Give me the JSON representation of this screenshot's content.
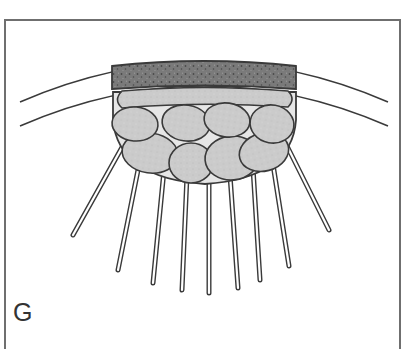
{
  "figure": {
    "panel_label": "G"
  },
  "colors": {
    "frame": "#6f6f6f",
    "outline": "#3a3a3a",
    "dark_band": "#7a7a7a",
    "dark_band_speckle": "#4a4a4a",
    "light_cell": "#cbcbcb",
    "bowl_fill": "#e6e6e6",
    "rod_fill": "#ffffff",
    "label": "#333333"
  },
  "parts": {
    "arcs": [
      "outer-arc",
      "inner-arc"
    ],
    "band": "dark-band",
    "top_cell": "elongated-cell",
    "cell_count": 8,
    "rod_count": 9
  }
}
